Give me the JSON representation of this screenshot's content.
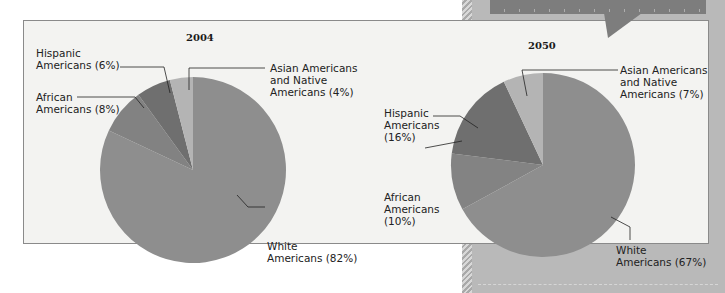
{
  "chart_data": [
    {
      "type": "pie",
      "title": "2004",
      "categories": [
        "White Americans",
        "African Americans",
        "Hispanic Americans",
        "Asian Americans and Native Americans"
      ],
      "values": [
        82,
        8,
        6,
        4
      ],
      "unit": "%",
      "colors": [
        "#8e8e8e",
        "#828282",
        "#6f6f6f",
        "#b4b4b4"
      ]
    },
    {
      "type": "pie",
      "title": "2050",
      "categories": [
        "White Americans",
        "African Americans",
        "Hispanic Americans",
        "Asian Americans and Native Americans"
      ],
      "values": [
        67,
        10,
        16,
        7
      ],
      "unit": "%",
      "colors": [
        "#8e8e8e",
        "#838383",
        "#6f6f6f",
        "#b4b4b4"
      ]
    }
  ],
  "pies": {
    "p2004": {
      "title": "2004",
      "labels": {
        "hispanic": [
          "Hispanic",
          "Americans (6%)"
        ],
        "african": [
          "African",
          "Americans (8%)"
        ],
        "asian": [
          "Asian Americans",
          "and Native",
          "Americans (4%)"
        ],
        "white": [
          "White",
          "Americans (82%)"
        ]
      }
    },
    "p2050": {
      "title": "2050",
      "labels": {
        "hispanic": [
          "Hispanic",
          "Americans",
          "(16%)"
        ],
        "african": [
          "African",
          "Americans",
          "(10%)"
        ],
        "asian": [
          "Asian Americans",
          "and Native",
          "Americans (7%)"
        ],
        "white": [
          "White",
          "Americans (67%)"
        ]
      }
    }
  },
  "colors": {
    "box_bg": "#f3f3f1",
    "panel_bg": "#b9b9b9",
    "callout_bg": "#7d7d7d"
  }
}
